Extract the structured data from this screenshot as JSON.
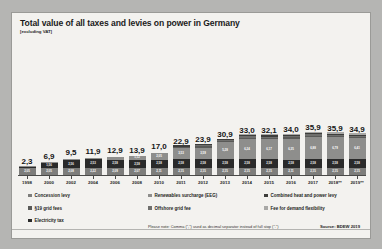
{
  "chart_data": {
    "type": "bar",
    "title": "Total value of all taxes and levies on power in Germany",
    "subtitle": "[excluding VAT]",
    "xlabel": "",
    "ylabel": "",
    "grid": false,
    "stacked": true,
    "legend_position": "bottom",
    "note": "Please note: Comma (\",\") used as decimal separator instead of full stop (\".\")",
    "source": "Source: BDEW 2019",
    "categories": [
      "1998",
      "2000",
      "2002",
      "2004",
      "2006",
      "2008",
      "2010",
      "2011",
      "2012",
      "2013",
      "2014",
      "2015",
      "2016",
      "2017",
      "2018**",
      "2019**"
    ],
    "totals": [
      "2,3",
      "6,9",
      "9,5",
      "11,9",
      "12,9",
      "13,9",
      "17,0",
      "22,9",
      "23,9",
      "30,9",
      "33,0",
      "32,1",
      "34,0",
      "35,9",
      "35,9",
      "34,9"
    ],
    "totals_numeric": [
      2.3,
      6.9,
      9.5,
      11.9,
      12.9,
      13.9,
      17.0,
      22.9,
      23.9,
      30.9,
      33.0,
      32.1,
      34.0,
      35.9,
      35.9,
      34.9
    ],
    "ylim": [
      0,
      38
    ],
    "series": [
      {
        "name": "Concession levy",
        "key": "concession",
        "color": "#7d7d7b",
        "values": [
          2.05,
          2.05,
          2.08,
          2.22,
          2.09,
          2.07,
          2.11,
          2.15,
          2.15,
          2.15,
          2.15,
          2.15,
          2.11,
          2.15,
          2.15,
          2.15
        ],
        "labels": [
          "2,05",
          "2,05",
          "2,08",
          "2,22",
          "2,09",
          "2,07",
          "2,11",
          "2,15",
          "2,15",
          "2,15",
          "2,15",
          "2,15",
          "2,11",
          "2,15",
          "2,15",
          "2,15"
        ]
      },
      {
        "name": "Electricity tax",
        "key": "electricity_tax",
        "color": "#2a2a2a",
        "values": [
          0.26,
          1.56,
          2.56,
          2.53,
          2.58,
          2.58,
          2.58,
          2.58,
          2.58,
          2.58,
          2.58,
          2.58,
          2.58,
          2.58,
          2.58,
          2.58
        ],
        "labels": [
          "0,26",
          "1,56",
          "2,56",
          "2,53",
          "2,58",
          "2,58",
          "2,58",
          "2,58",
          "2,58",
          "2,58",
          "2,58",
          "2,58",
          "2,58",
          "2,58",
          "2,58",
          "2,58"
        ]
      },
      {
        "name": "Renewables surcharge (EEG)",
        "key": "eeg",
        "color": "#8e8e8c",
        "values": [
          0.08,
          0.2,
          0.35,
          0.51,
          0.88,
          1.12,
          2.05,
          3.53,
          3.59,
          5.28,
          6.24,
          6.17,
          6.35,
          6.88,
          6.79,
          6.41
        ],
        "labels": [
          "0,08",
          "0,20",
          "0,35",
          "0,51",
          "0,88",
          "1,12",
          "2,05",
          "3,53",
          "3,59",
          "5,28",
          "6,24",
          "6,17",
          "6,35",
          "6,88",
          "6,79",
          "6,41"
        ]
      },
      {
        "name": "§19 grid fees",
        "key": "grid_fees_19",
        "color": "#5a5a58",
        "values": [
          0,
          0,
          0,
          0,
          0,
          0,
          0,
          0.15,
          0.33,
          0.09,
          0.09,
          0.08,
          0.38,
          0.39,
          0.37,
          0.31
        ],
        "labels": [
          "",
          "",
          "",
          "",
          "",
          "",
          "",
          "0,15",
          "0,33",
          "0,09",
          "0,09",
          "0,08",
          "0,38",
          "0,39",
          "0,37",
          "0,31"
        ]
      },
      {
        "name": "Offshore grid fee",
        "key": "offshore_grid_fee",
        "color": "#6f6f6d",
        "values": [
          0,
          0,
          0,
          0,
          0,
          0,
          0,
          0,
          0.25,
          0.25,
          0.4,
          0.4,
          0.04,
          0.03,
          0.04,
          0.42
        ],
        "labels": [
          "",
          "",
          "",
          "",
          "",
          "",
          "",
          "",
          "0,25",
          "0,25",
          "0,40",
          "0,40",
          "0,04",
          "0,03",
          "0,04",
          "0,42"
        ]
      },
      {
        "name": "Combined heat and power levy",
        "key": "chp_levy",
        "color": "#3d3d3b",
        "values": [
          0,
          0,
          0,
          0,
          0,
          0,
          0,
          0.03,
          0.13,
          0.13,
          0.18,
          0.25,
          0.45,
          0.44,
          0.35,
          0.28
        ],
        "labels": [
          "",
          "",
          "",
          "",
          "",
          "",
          "",
          "0,03",
          "0,13",
          "0,13",
          "0,18",
          "0,25",
          "0,45",
          "0,44",
          "0,35",
          "0,28"
        ]
      },
      {
        "name": "Fee for demand flexibility",
        "key": "demand_flexibility",
        "color": "#a8a8a6",
        "values": [
          0,
          0,
          0,
          0,
          0,
          0,
          0,
          0,
          0,
          0,
          0.01,
          0.01,
          0.01,
          0.01,
          0.01,
          0.01
        ],
        "labels": [
          "",
          "",
          "",
          "",
          "",
          "",
          "",
          "",
          "",
          "",
          "0,01",
          "0,01",
          "0,01",
          "0,01",
          "0,01",
          "0,01"
        ]
      }
    ],
    "bar_segment_labels_major": {
      "eeg_2013": "5,28",
      "eeg_2014": "6,24",
      "eeg_2015": "6,17",
      "eeg_2016": "6,35",
      "eeg_2017": "6,88",
      "eeg_2018": "6,79",
      "eeg_2019": "6,41"
    }
  },
  "legend": {
    "columns": [
      {
        "items": [
          {
            "label": "Concession levy",
            "color": "#7d7d7b"
          },
          {
            "label": "§19 grid fees",
            "color": "#5a5a58"
          },
          {
            "label": "Electricity tax",
            "color": "#2a2a2a"
          }
        ]
      },
      {
        "items": [
          {
            "label": "Renewables surcharge (EEG)",
            "color": "#8e8e8c"
          },
          {
            "label": "Offshore grid fee",
            "color": "#6f6f6d"
          }
        ]
      },
      {
        "items": [
          {
            "label": "Combined heat and power levy",
            "color": "#3d3d3b"
          },
          {
            "label": "Fee for demand flexibility",
            "color": "#a8a8a6"
          }
        ]
      }
    ]
  }
}
